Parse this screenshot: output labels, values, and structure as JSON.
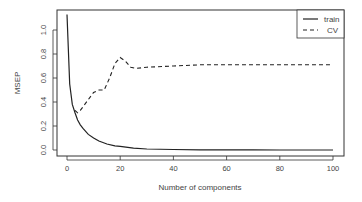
{
  "chart_data": {
    "type": "line",
    "title": "",
    "xlabel": "Number of components",
    "ylabel": "MSEP",
    "xlim": [
      0,
      100
    ],
    "ylim": [
      0,
      1.15
    ],
    "xticks": [
      0,
      20,
      40,
      60,
      80,
      100
    ],
    "yticks": [
      0.0,
      0.2,
      0.4,
      0.6,
      0.8,
      1.0
    ],
    "ytick_labels": [
      "0.0",
      "0.2",
      "0.4",
      "0.6",
      "0.8",
      "1.0"
    ],
    "grid": false,
    "legend_position": "topright",
    "series": [
      {
        "name": "train",
        "style": "solid",
        "x": [
          0,
          1,
          2,
          3,
          4,
          5,
          6,
          8,
          10,
          12,
          15,
          18,
          20,
          25,
          30,
          40,
          50,
          60,
          70,
          80,
          90,
          100
        ],
        "values": [
          1.13,
          0.55,
          0.38,
          0.31,
          0.25,
          0.21,
          0.18,
          0.13,
          0.1,
          0.075,
          0.05,
          0.035,
          0.03,
          0.015,
          0.008,
          0.004,
          0.002,
          0.001,
          0.001,
          0.0,
          0.0,
          0.0
        ]
      },
      {
        "name": "CV",
        "style": "dashed",
        "x": [
          3,
          4,
          5,
          6,
          8,
          10,
          12,
          14,
          16,
          18,
          20,
          22,
          24,
          26,
          30,
          40,
          50,
          60,
          70,
          80,
          90,
          100
        ],
        "values": [
          0.33,
          0.31,
          0.33,
          0.36,
          0.42,
          0.48,
          0.5,
          0.5,
          0.6,
          0.72,
          0.77,
          0.74,
          0.69,
          0.68,
          0.69,
          0.7,
          0.71,
          0.71,
          0.71,
          0.71,
          0.71,
          0.71
        ]
      }
    ]
  },
  "legend": {
    "items": [
      {
        "label": "train",
        "style": "solid"
      },
      {
        "label": "CV",
        "style": "dashed"
      }
    ]
  },
  "colors": {
    "line": "#222222",
    "axis": "#333333",
    "text": "#444444"
  }
}
